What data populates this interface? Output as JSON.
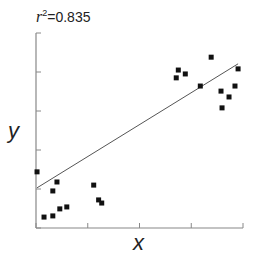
{
  "chart_data": {
    "type": "scatter",
    "title": "",
    "annotation": {
      "prefix": "r",
      "exponent": "2",
      "text": "=0.835",
      "full": "r²=0.835"
    },
    "xlabel": "x",
    "ylabel": "y",
    "xlim": [
      0,
      8
    ],
    "ylim": [
      0,
      5
    ],
    "x_ticks": [
      0,
      2,
      4,
      6,
      8
    ],
    "y_ticks": [
      0,
      1,
      2,
      3,
      4,
      5
    ],
    "x_tick_labels": [],
    "y_tick_labels": [],
    "grid": false,
    "legend": null,
    "series": [
      {
        "name": "observations",
        "marker": "square",
        "color": "#111111",
        "points": [
          {
            "x": 0.04,
            "y": 1.44
          },
          {
            "x": 0.31,
            "y": 0.28
          },
          {
            "x": 0.65,
            "y": 0.31
          },
          {
            "x": 0.65,
            "y": 0.95
          },
          {
            "x": 0.81,
            "y": 1.18
          },
          {
            "x": 0.92,
            "y": 0.49
          },
          {
            "x": 1.19,
            "y": 0.54
          },
          {
            "x": 2.23,
            "y": 1.1
          },
          {
            "x": 2.42,
            "y": 0.72
          },
          {
            "x": 2.54,
            "y": 0.64
          },
          {
            "x": 5.42,
            "y": 3.85
          },
          {
            "x": 5.5,
            "y": 4.05
          },
          {
            "x": 5.77,
            "y": 3.95
          },
          {
            "x": 6.35,
            "y": 3.64
          },
          {
            "x": 6.77,
            "y": 4.38
          },
          {
            "x": 7.15,
            "y": 3.51
          },
          {
            "x": 7.19,
            "y": 3.08
          },
          {
            "x": 7.46,
            "y": 3.36
          },
          {
            "x": 7.69,
            "y": 3.64
          },
          {
            "x": 7.81,
            "y": 4.08
          }
        ]
      }
    ],
    "regression_line": {
      "color": "#555555",
      "from": {
        "x": 0.04,
        "y": 1.03
      },
      "to": {
        "x": 7.81,
        "y": 4.21
      }
    }
  },
  "axes_style": {
    "axis_color": "#888888",
    "point_color": "#111111",
    "line_color": "#555555"
  }
}
